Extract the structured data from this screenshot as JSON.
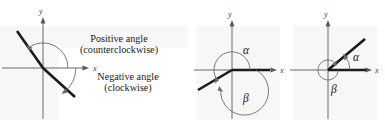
{
  "figure": {
    "width": 385,
    "height": 130,
    "background": "#ffffff",
    "ray_color": "#1a1a1a",
    "axis_color": "#58585a",
    "arc_color": "#6b6b6d",
    "panel_background": "#f0f0f0"
  },
  "panels": [
    {
      "id": "definition",
      "axes": {
        "x_label": "x",
        "y_label": "y"
      },
      "callouts": [
        {
          "id": "positive",
          "line1": "Positive angle",
          "line2": "(counterclockwise)"
        },
        {
          "id": "negative",
          "line1": "Negative angle",
          "line2": "(clockwise)"
        }
      ],
      "terminal_ray_degrees": 153,
      "initial_ray_degrees": -27
    },
    {
      "id": "coterminal-pair-one",
      "axes": {
        "x_label": "x",
        "y_label": "y"
      },
      "angles": [
        {
          "id": "alpha",
          "symbol": "α",
          "direction": "counterclockwise",
          "degrees": 210
        },
        {
          "id": "beta",
          "symbol": "β",
          "direction": "clockwise",
          "degrees": -150
        }
      ],
      "terminal_ray_degrees": 210
    },
    {
      "id": "coterminal-pair-two",
      "axes": {
        "x_label": "x",
        "y_label": "y"
      },
      "angles": [
        {
          "id": "alpha",
          "symbol": "α",
          "direction": "counterclockwise",
          "degrees": 40
        },
        {
          "id": "beta",
          "symbol": "β",
          "direction": "clockwise",
          "degrees": -320
        }
      ],
      "terminal_ray_degrees": 40
    }
  ]
}
